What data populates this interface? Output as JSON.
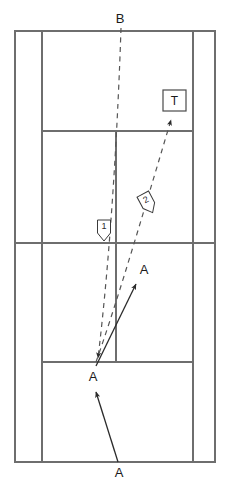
{
  "diagram": {
    "colors": {
      "court_line": "#6e6e6e",
      "trajectory_solid": "#2b2b2b",
      "trajectory_dashed": "#555555",
      "label_text": "#1a1a1a",
      "background": "#ffffff"
    },
    "court": {
      "outer_left_x": 15,
      "outer_right_x": 215,
      "inner_left_x": 42,
      "inner_right_x": 193,
      "top_baseline_y": 31,
      "top_service_y": 131,
      "net_y": 243,
      "bottom_service_y": 362,
      "bottom_baseline_y": 462,
      "center_line_x": 116
    },
    "labels": [
      {
        "id": "label-b-top",
        "text": "B",
        "x": 120,
        "y": 20
      },
      {
        "id": "label-a-upper",
        "text": "A",
        "x": 144,
        "y": 271
      },
      {
        "id": "label-a-mid",
        "text": "A",
        "x": 93,
        "y": 378
      },
      {
        "id": "label-a-bottom",
        "text": "A",
        "x": 119,
        "y": 474
      }
    ],
    "target_box": {
      "id": "target-t",
      "text": "T",
      "x": 163,
      "y": 90,
      "width": 23,
      "height": 21
    },
    "shot_markers": [
      {
        "id": "shot-marker-1",
        "text": "1",
        "x": 104,
        "y": 229,
        "rotation": 0
      },
      {
        "id": "shot-marker-2",
        "text": "2",
        "x": 147,
        "y": 202,
        "rotation": -28
      }
    ],
    "trajectories": [
      {
        "id": "trajectory-dashed-1",
        "style": "dashed",
        "label": "1",
        "from": [
          121,
          28
        ],
        "to": [
          97,
          362
        ],
        "arrowhead": "end"
      },
      {
        "id": "trajectory-dashed-2",
        "style": "dashed",
        "label": "2",
        "from": [
          96,
          362
        ],
        "to": [
          172,
          116
        ],
        "arrowhead": "end"
      },
      {
        "id": "trajectory-solid-upper",
        "style": "solid",
        "from": [
          96,
          366
        ],
        "to": [
          137,
          283
        ],
        "arrowhead": "end"
      },
      {
        "id": "trajectory-solid-lower",
        "style": "solid",
        "from": [
          118,
          462
        ],
        "to": [
          96,
          391
        ],
        "arrowhead": "end"
      }
    ]
  }
}
